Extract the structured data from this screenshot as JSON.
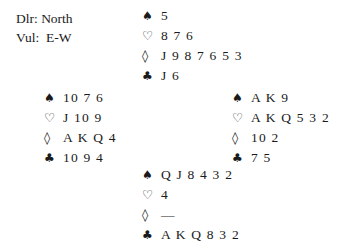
{
  "deal_info": {
    "dealer_label": "Dlr:",
    "dealer_value": "North",
    "vul_label": "Vul:",
    "vul_value": "E-W"
  },
  "suit_symbols": {
    "spades": "♠",
    "hearts": "♡",
    "diamonds": "◊",
    "clubs": "♣"
  },
  "hands": {
    "north": {
      "spades": "5",
      "hearts": "8 7 6",
      "diamonds": "J 9 8 7 6 5 3",
      "clubs": "J 6"
    },
    "west": {
      "spades": "10 7 6",
      "hearts": "J 10 9",
      "diamonds": "A K Q 4",
      "clubs": "10 9 4"
    },
    "east": {
      "spades": "A K 9",
      "hearts": "A K Q 5 3 2",
      "diamonds": "10 2",
      "clubs": "7 5"
    },
    "south": {
      "spades": "Q J 8 4 3 2",
      "hearts": "4",
      "diamonds": "—",
      "clubs": "A K Q 8 3 2"
    }
  }
}
